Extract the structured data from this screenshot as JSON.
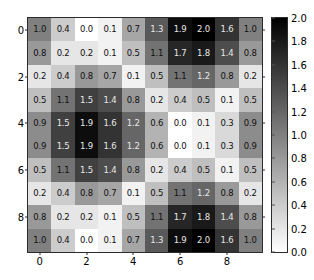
{
  "chart_data": {
    "type": "heatmap",
    "title": "",
    "xlabel": "",
    "ylabel": "",
    "colormap": "gray_r",
    "vmin": 0.0,
    "vmax": 2.0,
    "grid": false,
    "legend_position": "right",
    "x": [
      0,
      1,
      2,
      3,
      4,
      5,
      6,
      7,
      8,
      9
    ],
    "y": [
      0,
      1,
      2,
      3,
      4,
      5,
      6,
      7,
      8,
      9
    ],
    "xticks": [
      0,
      2,
      4,
      6,
      8
    ],
    "xticklabels": [
      "0",
      "2",
      "4",
      "6",
      "8"
    ],
    "yticks": [
      0,
      2,
      4,
      6,
      8
    ],
    "yticklabels": [
      "0",
      "2",
      "4",
      "6",
      "8"
    ],
    "annotations_shown": true,
    "annotation_format": "0.1f",
    "values": [
      [
        1.0,
        0.4,
        0.0,
        0.1,
        0.7,
        1.3,
        1.9,
        2.0,
        1.6,
        1.0
      ],
      [
        0.8,
        0.2,
        0.2,
        0.1,
        0.5,
        1.1,
        1.7,
        1.8,
        1.4,
        0.8
      ],
      [
        0.2,
        0.4,
        0.8,
        0.7,
        0.1,
        0.5,
        1.1,
        1.2,
        0.8,
        0.2
      ],
      [
        0.5,
        1.1,
        1.5,
        1.4,
        0.8,
        0.2,
        0.4,
        0.5,
        0.1,
        0.5
      ],
      [
        0.9,
        1.5,
        1.9,
        1.6,
        1.2,
        0.6,
        0.0,
        0.1,
        0.3,
        0.9
      ],
      [
        0.9,
        1.5,
        1.9,
        1.6,
        1.2,
        0.6,
        0.0,
        0.1,
        0.3,
        0.9
      ],
      [
        0.5,
        1.1,
        1.5,
        1.4,
        0.8,
        0.2,
        0.4,
        0.5,
        0.1,
        0.5
      ],
      [
        0.2,
        0.4,
        0.8,
        0.7,
        0.1,
        0.5,
        1.1,
        1.2,
        0.8,
        0.2
      ],
      [
        0.8,
        0.2,
        0.2,
        0.1,
        0.5,
        1.1,
        1.7,
        1.8,
        1.4,
        0.8
      ],
      [
        1.0,
        0.4,
        0.0,
        0.1,
        0.7,
        1.3,
        1.9,
        2.0,
        1.6,
        1.0
      ]
    ],
    "colorbar": {
      "ticks": [
        0.0,
        0.2,
        0.4,
        0.6,
        0.8,
        1.0,
        1.2,
        1.4,
        1.6,
        1.8,
        2.0
      ],
      "ticklabels": [
        "0.0",
        "0.2",
        "0.4",
        "0.6",
        "0.8",
        "1.0",
        "1.2",
        "1.4",
        "1.6",
        "1.8",
        "2.0"
      ],
      "orientation": "vertical",
      "low_color": "#ffffff",
      "high_color": "#000000"
    }
  },
  "figure": {
    "background_color": "#ffffff",
    "axes_edge_color": "#2b2b2b",
    "tick_label_color": "#000000"
  }
}
